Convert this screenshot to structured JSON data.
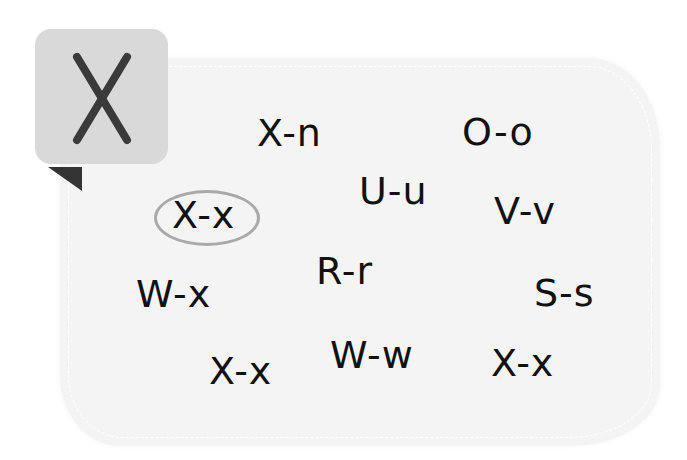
{
  "badge": {
    "letter": "X"
  },
  "pairs": [
    {
      "text": "X-n"
    },
    {
      "text": "O-o"
    },
    {
      "text": "X-x"
    },
    {
      "text": "U-u"
    },
    {
      "text": "V-v"
    },
    {
      "text": "W-x"
    },
    {
      "text": "R-r"
    },
    {
      "text": "S-s"
    },
    {
      "text": "X-x"
    },
    {
      "text": "W-w"
    },
    {
      "text": "X-x"
    }
  ],
  "circled_index": 2,
  "colors": {
    "badge": "#d9d9d9",
    "card": "#f4f4f4",
    "circle": "#a9a9a9",
    "ink": "#111111"
  }
}
